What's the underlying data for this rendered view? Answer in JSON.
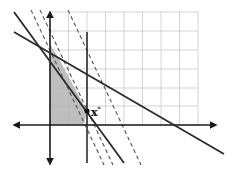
{
  "diagram": {
    "type": "linear-programming-feasible-region",
    "optimum_label": "x*",
    "optimum_label_main": "x",
    "optimum_label_sup": "*",
    "colors": {
      "grid": "#c8c8c8",
      "axes": "#1a1a1a",
      "constraint": "#2a2a2a",
      "dashed": "#555555",
      "feasible_region": "#b3b3b3",
      "background": "#ffffff"
    },
    "grid": {
      "columns": 8,
      "rows": 6
    },
    "elements": [
      "x-axis with arrows",
      "y-axis with arrows",
      "grid",
      "constraint line (shallow slope)",
      "constraint line (steep slope)",
      "vertical constraint line",
      "dashed objective contour lines (3)",
      "shaded feasible region",
      "optimal point x*"
    ]
  }
}
